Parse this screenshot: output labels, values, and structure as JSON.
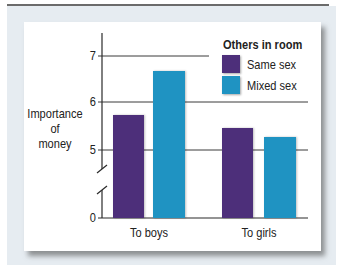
{
  "chart_data": {
    "type": "bar",
    "title": "",
    "xlabel": "",
    "ylabel": "Importance of money",
    "ylabel_lines": [
      "Importance",
      "of",
      "money"
    ],
    "categories": [
      "To boys",
      "To girls"
    ],
    "series": [
      {
        "name": "Same sex",
        "color": "#4d2f7a",
        "values": [
          5.73,
          5.46
        ]
      },
      {
        "name": "Mixed sex",
        "color": "#1f93c2",
        "values": [
          6.65,
          5.27
        ]
      }
    ],
    "legend_title": "Others in room",
    "legend_position": "top-right",
    "yticks": [
      0,
      5,
      6,
      7
    ],
    "ylim": [
      0,
      7.4
    ],
    "axis_break": true,
    "axis_break_between": [
      0,
      5
    ],
    "grid": true
  },
  "layout": {
    "x_axis_px": 102,
    "baseline_px": 218,
    "scale": {
      "value5_px": 150,
      "px_per_unit": 48
    },
    "gridlines": [
      {
        "value": 7,
        "y": 56,
        "x1": 102,
        "x2": 209
      },
      {
        "value": 6,
        "y": 102,
        "x1": 102,
        "x2": 308
      },
      {
        "value": 5,
        "y": 150,
        "x1": 102,
        "x2": 308
      }
    ],
    "bars": [
      {
        "x": 113,
        "w": 31
      },
      {
        "x": 153,
        "w": 32
      },
      {
        "x": 222,
        "w": 31
      },
      {
        "x": 264,
        "w": 32
      }
    ]
  }
}
